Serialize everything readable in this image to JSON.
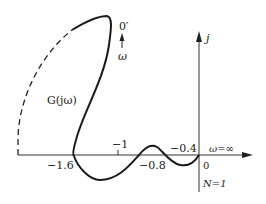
{
  "diagram": {
    "type": "nyquist-plot",
    "axis_labels": {
      "imag": "j",
      "origin": "0"
    },
    "real_axis_ticks": {
      "m1_6": "−1.6",
      "m1": "−1",
      "m0_8": "−0.8",
      "m0_4": "−0.4"
    },
    "curve_label": "G(jω)",
    "omega_start_label": "0′",
    "omega_label": "ω",
    "omega_inf_label": "ω=∞",
    "encirclement_label": "N=1",
    "colors": {
      "line": "#1a1a1a",
      "text": "#222222"
    }
  }
}
